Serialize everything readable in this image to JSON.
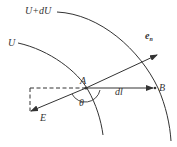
{
  "diagram": {
    "type": "equipotential-field-diagram",
    "colors": {
      "stroke": "#333333",
      "background": "#ffffff"
    },
    "curves": [
      {
        "id": "U",
        "label": "U"
      },
      {
        "id": "U_plus_dU",
        "label": "U+dU"
      }
    ],
    "points": [
      {
        "id": "A",
        "label": "A"
      },
      {
        "id": "B",
        "label": "B"
      }
    ],
    "vectors": [
      {
        "id": "E",
        "label": "E",
        "from": "A",
        "direction": "down-left"
      },
      {
        "id": "e_n",
        "label": "e",
        "subscript": "n",
        "from": "A",
        "direction": "up-right"
      },
      {
        "id": "dl",
        "label": "dl",
        "from": "A",
        "to": "B"
      }
    ],
    "angle": {
      "label": "θ",
      "between": [
        "E",
        "dl"
      ]
    },
    "dashed_components": [
      "horizontal",
      "vertical"
    ]
  }
}
